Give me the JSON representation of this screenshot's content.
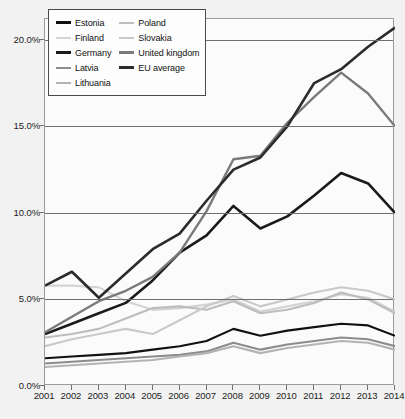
{
  "chart_data": {
    "type": "line",
    "title": "",
    "subtitle": "",
    "xlabel": "",
    "ylabel": "",
    "x": [
      2001,
      2002,
      2003,
      2004,
      2005,
      2006,
      2007,
      2008,
      2009,
      2010,
      2011,
      2012,
      2013,
      2014
    ],
    "categories": [
      "2001",
      "2002",
      "2003",
      "2004",
      "2005",
      "2006",
      "2007",
      "2008",
      "2009",
      "2010",
      "2011",
      "2012",
      "2013",
      "2014"
    ],
    "xlim": [
      2001,
      2014
    ],
    "ylim": [
      0,
      21.2
    ],
    "yticks": [
      0,
      5,
      10,
      15,
      20
    ],
    "ytick_labels": [
      "0.0%",
      "5.0%",
      "10.0%",
      "15.0%",
      "20.0%"
    ],
    "grid": true,
    "grid_axis": "y",
    "legend_position": "top-left",
    "value_format": "percent",
    "series": [
      {
        "name": "Estonia",
        "color": "#111111",
        "width": 2.1,
        "values": [
          1.6,
          1.7,
          1.8,
          1.9,
          2.1,
          2.3,
          2.6,
          3.3,
          2.9,
          3.2,
          3.4,
          3.6,
          3.5,
          2.9
        ]
      },
      {
        "name": "Finland",
        "color": "#d4d4d4",
        "width": 2.1,
        "values": [
          5.8,
          5.8,
          5.7,
          4.9,
          4.4,
          4.5,
          4.7,
          5.0,
          4.3,
          4.6,
          4.9,
          5.3,
          5.1,
          4.3
        ]
      },
      {
        "name": "Germany",
        "color": "#1b1b1b",
        "width": 2.6,
        "values": [
          3.0,
          3.6,
          4.2,
          4.8,
          6.1,
          7.7,
          8.7,
          10.4,
          9.1,
          9.8,
          11.0,
          12.3,
          11.7,
          10.0
        ]
      },
      {
        "name": "Latvia",
        "color": "#8c8c8c",
        "width": 2.1,
        "values": [
          1.3,
          1.4,
          1.5,
          1.6,
          1.7,
          1.8,
          2.0,
          2.5,
          2.1,
          2.4,
          2.6,
          2.8,
          2.7,
          2.3
        ]
      },
      {
        "name": "Lithuania",
        "color": "#b3b3b3",
        "width": 2.1,
        "values": [
          1.1,
          1.2,
          1.3,
          1.4,
          1.5,
          1.7,
          1.9,
          2.3,
          1.9,
          2.2,
          2.4,
          2.6,
          2.5,
          2.1
        ]
      },
      {
        "name": "Poland",
        "color": "#bdbdbd",
        "width": 2.1,
        "values": [
          2.8,
          3.0,
          3.3,
          3.9,
          4.5,
          4.6,
          4.4,
          4.9,
          4.2,
          4.4,
          4.8,
          5.4,
          5.0,
          4.2
        ]
      },
      {
        "name": "Slovakia",
        "color": "#c9c9c9",
        "width": 2.1,
        "values": [
          2.3,
          2.7,
          3.0,
          3.3,
          3.0,
          3.8,
          4.6,
          5.2,
          4.6,
          5.0,
          5.4,
          5.7,
          5.5,
          5.0
        ]
      },
      {
        "name": "United kingdom",
        "color": "#7a7a7a",
        "width": 2.4,
        "values": [
          3.1,
          4.0,
          4.9,
          5.5,
          6.3,
          7.7,
          10.1,
          13.1,
          13.3,
          15.2,
          16.7,
          18.1,
          16.9,
          15.0
        ]
      },
      {
        "name": "EU average",
        "color": "#2b2b2b",
        "width": 2.6,
        "values": [
          5.8,
          6.6,
          5.1,
          6.5,
          7.9,
          8.8,
          10.7,
          12.5,
          13.2,
          15.0,
          17.5,
          18.3,
          19.6,
          20.7
        ]
      }
    ]
  },
  "legend": {
    "columns": [
      {
        "items": [
          {
            "label": "Estonia",
            "color": "#111111",
            "thickness": 3
          },
          {
            "label": "Finland",
            "color": "#d4d4d4",
            "thickness": 2
          },
          {
            "label": "Germany",
            "color": "#1b1b1b",
            "thickness": 3
          },
          {
            "label": "Latvia",
            "color": "#8c8c8c",
            "thickness": 2
          },
          {
            "label": "Lithuania",
            "color": "#b3b3b3",
            "thickness": 2
          }
        ]
      },
      {
        "items": [
          {
            "label": "Poland",
            "color": "#bdbdbd",
            "thickness": 2
          },
          {
            "label": "Slovakia",
            "color": "#c9c9c9",
            "thickness": 2
          },
          {
            "label": "United kingdom",
            "color": "#7a7a7a",
            "thickness": 3
          },
          {
            "label": "EU average",
            "color": "#2b2b2b",
            "thickness": 3
          }
        ]
      }
    ]
  },
  "colors": {
    "page_background": "#f2f2f2",
    "plot_background": "#fbfbfb",
    "plot_border": "#9a9a9a",
    "gridline": "#6f6f6f",
    "axis_text": "#1c1c1c",
    "legend_border": "#4a4a4a",
    "legend_background": "#fdfdfd"
  }
}
